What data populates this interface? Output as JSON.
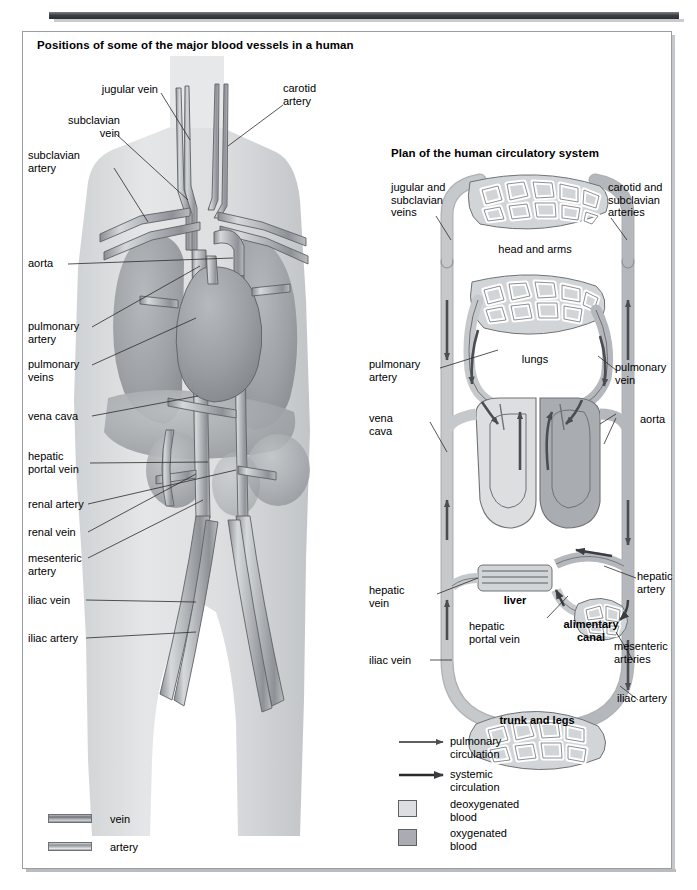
{
  "figure": {
    "left_panel_title": "Positions of some of the major blood vessels in a human",
    "right_panel_title": "Plan of the human circulatory system"
  },
  "left_panel": {
    "labels": [
      {
        "id": "jugular-vein",
        "text": "jugular vein"
      },
      {
        "id": "carotid-artery",
        "text": "carotid\nartery"
      },
      {
        "id": "subclavian-vein",
        "text": "subclavian\nvein"
      },
      {
        "id": "subclavian-artery",
        "text": "subclavian\nartery"
      },
      {
        "id": "aorta",
        "text": "aorta"
      },
      {
        "id": "pulmonary-artery",
        "text": "pulmonary\nartery"
      },
      {
        "id": "pulmonary-veins",
        "text": "pulmonary\nveins"
      },
      {
        "id": "vena-cava",
        "text": "vena cava"
      },
      {
        "id": "hepatic-portal-vein",
        "text": "hepatic\nportal vein"
      },
      {
        "id": "renal-artery",
        "text": "renal artery"
      },
      {
        "id": "renal-vein",
        "text": "renal vein"
      },
      {
        "id": "mesenteric-artery",
        "text": "mesenteric\nartery"
      },
      {
        "id": "iliac-vein",
        "text": "iliac vein"
      },
      {
        "id": "iliac-artery",
        "text": "iliac artery"
      }
    ],
    "legend": [
      {
        "id": "vein",
        "text": "vein"
      },
      {
        "id": "artery",
        "text": "artery"
      }
    ]
  },
  "right_panel": {
    "labels": [
      {
        "id": "jugular-subclavian-veins",
        "text": "jugular and\nsubclavian\nveins"
      },
      {
        "id": "carotid-subclavian-arteries",
        "text": "carotid and\nsubclavian\narteries"
      },
      {
        "id": "pulmonary-artery",
        "text": "pulmonary\nartery"
      },
      {
        "id": "pulmonary-vein",
        "text": "pulmonary\nvein"
      },
      {
        "id": "vena-cava",
        "text": "vena\ncava"
      },
      {
        "id": "aorta",
        "text": "aorta"
      },
      {
        "id": "hepatic-vein",
        "text": "hepatic\nvein"
      },
      {
        "id": "hepatic-artery",
        "text": "hepatic\nartery"
      },
      {
        "id": "hepatic-portal-vein",
        "text": "hepatic\nportal vein"
      },
      {
        "id": "mesenteric-arteries",
        "text": "mesenteric\narteries"
      },
      {
        "id": "iliac-vein",
        "text": "iliac vein"
      },
      {
        "id": "iliac-artery",
        "text": "iliac artery"
      }
    ],
    "organs": [
      {
        "id": "head-and-arms",
        "text": "head and arms"
      },
      {
        "id": "lungs",
        "text": "lungs"
      },
      {
        "id": "liver",
        "text": "liver"
      },
      {
        "id": "alimentary-canal",
        "text": "alimentary\ncanal"
      },
      {
        "id": "trunk-and-legs",
        "text": "trunk and legs"
      }
    ],
    "legend": [
      {
        "id": "pulmonary-circulation",
        "text": "pulmonary\ncirculation",
        "kind": "arrow"
      },
      {
        "id": "systemic-circulation",
        "text": "systemic\ncirculation",
        "kind": "arrow"
      },
      {
        "id": "deoxygenated-blood",
        "text": "deoxygenated\nblood",
        "kind": "swatch"
      },
      {
        "id": "oxygenated-blood",
        "text": "oxygenated\nblood",
        "kind": "swatch"
      }
    ]
  },
  "colors": {
    "deoxygenated": "#dcdedf",
    "oxygenated": "#a9adb1",
    "vessel_outline": "#5d6165",
    "body_fill": "#dcdee0",
    "organ_fill": "#a8acb0",
    "rule": "#343a3e"
  }
}
